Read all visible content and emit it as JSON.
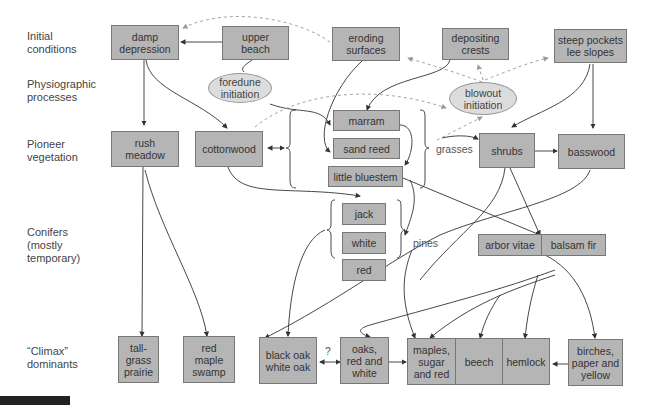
{
  "row_labels": [
    {
      "id": "initial",
      "text": "Initial\nconditions"
    },
    {
      "id": "physio",
      "text": "Physiographic\nprocesses"
    },
    {
      "id": "pioneer",
      "text": "Pioneer\nvegetation"
    },
    {
      "id": "conifers",
      "text": "Conifers\n(mostly\ntemporary)"
    },
    {
      "id": "climax",
      "text": "“Climax”\ndominants"
    }
  ],
  "nodes": {
    "damp_depression": "damp\ndepression",
    "upper_beach": "upper\nbeach",
    "eroding_surfaces": "eroding\nsurfaces",
    "depositing_crests": "depositing\ncrests",
    "steep_pockets": "steep pockets\nlee slopes",
    "foredune_initiation": "foredune\ninitiation",
    "blowout_initiation": "blowout\ninitiation",
    "rush_meadow": "rush\nmeadow",
    "cottonwood": "cottonwood",
    "marram": "marram",
    "sand_reed": "sand reed",
    "little_bluestem": "little bluestem",
    "shrubs": "shrubs",
    "basswood": "basswood",
    "jack": "jack",
    "white": "white",
    "red": "red",
    "arbor_vitae": "arbor vitae",
    "balsam_fir": "balsam fir",
    "tallgrass_prairie": "tall-\ngrass\nprairie",
    "red_maple_swamp": "red\nmaple\nswamp",
    "black_white_oak": "black oak\nwhite oak",
    "oaks_red_white": "oaks,\nred and\nwhite",
    "maples": "maples,\nsugar\nand red",
    "beech": "beech",
    "hemlock": "hemlock",
    "birches": "birches,\npaper and\nyellow"
  },
  "group_labels": {
    "grasses": "grasses",
    "pines": "pines",
    "question": "?"
  },
  "colors": {
    "box_fill": "#b5b5b5",
    "ellipse_fill": "#dcdcdc",
    "line": "#333333",
    "dashed": "#999999"
  },
  "figure_badge": "FIGURE"
}
